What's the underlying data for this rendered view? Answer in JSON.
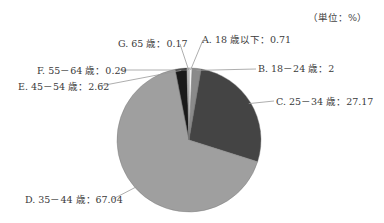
{
  "chart_data": {
    "type": "pie",
    "title": "",
    "unit_label": "（単位：%）",
    "start_angle_deg": 0,
    "direction": "clockwise",
    "slices": [
      {
        "key": "A",
        "label": "A. 18 歳以下：0.71",
        "category": "18 歳以下",
        "value": 0.71,
        "color": "#f2f2f2"
      },
      {
        "key": "B",
        "label": "B. 18－24 歳：2",
        "category": "18－24 歳",
        "value": 2,
        "color": "#8a8a8a"
      },
      {
        "key": "C",
        "label": "C. 25－34 歳：27.17",
        "category": "25－34 歳",
        "value": 27.17,
        "color": "#444444"
      },
      {
        "key": "D",
        "label": "D. 35－44 歳：67.04",
        "category": "35－44 歳",
        "value": 67.04,
        "color": "#9f9f9f"
      },
      {
        "key": "E",
        "label": "E. 45－54 歳：2.62",
        "category": "45－54 歳",
        "value": 2.62,
        "color": "#1a1a1a"
      },
      {
        "key": "F",
        "label": "F. 55－64 歳：0.29",
        "category": "55－64 歳",
        "value": 0.29,
        "color": "#d0d0d0"
      },
      {
        "key": "G",
        "label": "G. 65 歳：0.17",
        "category": "65 歳",
        "value": 0.17,
        "color": "#ffffff"
      }
    ]
  }
}
